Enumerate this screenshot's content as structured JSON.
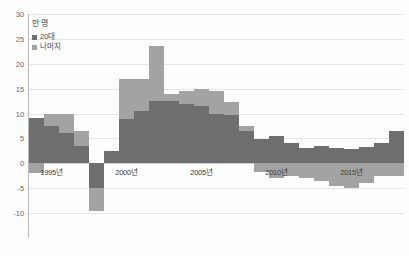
{
  "chart_data": {
    "type": "bar",
    "title": "",
    "subtitle": "",
    "unit_label": "만 명",
    "xlabel": "",
    "ylabel": "",
    "ylim": [
      -15,
      30
    ],
    "yticks": [
      30,
      25,
      20,
      15,
      10,
      5,
      0,
      -5,
      -10
    ],
    "ytick_labels": [
      "30",
      "25",
      "20",
      "15",
      "10",
      "5",
      "0",
      "-5",
      "-10"
    ],
    "grid": true,
    "stacked": true,
    "legend_position": "top-left",
    "colors": {
      "20s": "#6e6e6e",
      "rest": "#a3a3a3",
      "gridline": "#e6e6e6",
      "axis": "#b9b9b9",
      "background": "#fdfdfd"
    },
    "categories": [
      "1994",
      "1995",
      "1996",
      "1997",
      "1998",
      "1999",
      "2000",
      "2001",
      "2002",
      "2003",
      "2004",
      "2005",
      "2006",
      "2007",
      "2008",
      "2009",
      "2010",
      "2011",
      "2012",
      "2013",
      "2014",
      "2015",
      "2016",
      "2017",
      "2018"
    ],
    "xtick_labels": [
      "1995년",
      "2000년",
      "2005년",
      "2010년",
      "2015년"
    ],
    "xtick_categories": [
      "1995",
      "2000",
      "2005",
      "2010",
      "2015"
    ],
    "series": [
      {
        "name": "20대",
        "color": "#6e6e6e",
        "values": [
          9.2,
          7.5,
          6.0,
          3.5,
          -5.0,
          2.5,
          9.0,
          10.5,
          12.5,
          12.5,
          12.0,
          11.5,
          10.0,
          9.8,
          6.5,
          4.8,
          5.5,
          4.0,
          3.0,
          3.5,
          3.0,
          2.8,
          3.2,
          4.0,
          6.5
        ]
      },
      {
        "name": "나머지",
        "color": "#a3a3a3",
        "values": [
          -2.0,
          2.5,
          4.0,
          3.0,
          -4.5,
          0.0,
          8.0,
          6.5,
          11.0,
          1.5,
          2.5,
          3.5,
          4.5,
          2.5,
          1.0,
          -1.8,
          -3.0,
          -2.5,
          -3.0,
          -3.5,
          -4.5,
          -5.0,
          -4.0,
          -2.5,
          -2.5
        ]
      }
    ],
    "annotations": []
  },
  "legend": {
    "unit": "만 명",
    "items": [
      {
        "label": "20대",
        "color": "#6e6e6e"
      },
      {
        "label": "나머지",
        "color": "#a3a3a3"
      }
    ]
  }
}
